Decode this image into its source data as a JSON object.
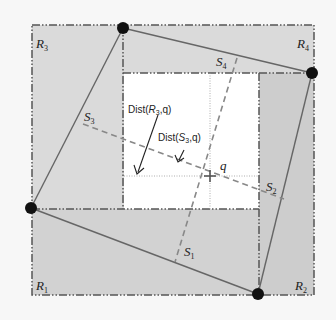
{
  "diagram": {
    "colors": {
      "background": "#f7f7f7",
      "region_light": "#dcdcdc",
      "region_dark": "#cfcfcf",
      "inner": "#ffffff",
      "polygon_edge": "#555555",
      "vertex": "#111111",
      "dash": "#888888"
    },
    "regions": [
      {
        "id": "R1",
        "base": "R",
        "sub": "1"
      },
      {
        "id": "R2",
        "base": "R",
        "sub": "2"
      },
      {
        "id": "R3",
        "base": "R",
        "sub": "3"
      },
      {
        "id": "R4",
        "base": "R",
        "sub": "4"
      }
    ],
    "segments": [
      {
        "id": "S1",
        "base": "S",
        "sub": "1"
      },
      {
        "id": "S2",
        "base": "S",
        "sub": "2"
      },
      {
        "id": "S3",
        "base": "S",
        "sub": "3"
      },
      {
        "id": "S4",
        "base": "S",
        "sub": "4"
      }
    ],
    "query_point": "q",
    "annotations": {
      "dist_r3": {
        "prefix": "Dist(",
        "base": "R",
        "sub": "3",
        "suffix": ",q)"
      },
      "dist_s3": {
        "prefix": "Dist(",
        "base": "S",
        "sub": "3",
        "suffix": ",q)"
      }
    }
  }
}
